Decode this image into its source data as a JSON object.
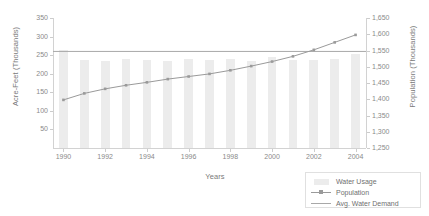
{
  "chart_data": {
    "type": "bar",
    "title": "",
    "xlabel": "Years",
    "ylabel": "Acre-Feet (Thousands)",
    "ylabel_secondary": "Population (Thousands)",
    "grid": false,
    "legend_position": "bottom-right",
    "categories": [
      1990,
      1991,
      1992,
      1993,
      1994,
      1995,
      1996,
      1997,
      1998,
      1999,
      2000,
      2001,
      2002,
      2003,
      2004
    ],
    "x_tick_labels": [
      "1990",
      "1992",
      "1994",
      "1996",
      "1998",
      "2000",
      "2002",
      "2004"
    ],
    "x_tick_values": [
      1990,
      1992,
      1994,
      1996,
      1998,
      2000,
      2002,
      2004
    ],
    "ylim": [
      0,
      350
    ],
    "y_tick_labels": [
      "50",
      "100",
      "150",
      "200",
      "250",
      "300",
      "350"
    ],
    "y_tick_values": [
      50,
      100,
      150,
      200,
      250,
      300,
      350
    ],
    "ylim_secondary": [
      1250,
      1650
    ],
    "y2_tick_labels": [
      "1,250",
      "1,300",
      "1,350",
      "1,400",
      "1,450",
      "1,500",
      "1,550",
      "1,600",
      "1,650"
    ],
    "y2_tick_values": [
      1250,
      1300,
      1350,
      1400,
      1450,
      1500,
      1550,
      1600,
      1650
    ],
    "series": [
      {
        "name": "Water Usage",
        "type": "bar",
        "axis": "left",
        "color": "#ececec",
        "values": [
          265,
          238,
          234,
          241,
          237,
          235,
          239,
          236,
          240,
          234,
          245,
          236,
          238,
          241,
          252
        ]
      },
      {
        "name": "Population",
        "type": "line",
        "axis": "right",
        "color": "#9a9a9a",
        "marker": "square",
        "values": [
          1398,
          1418,
          1432,
          1443,
          1452,
          1462,
          1470,
          1478,
          1489,
          1502,
          1516,
          1532,
          1552,
          1575,
          1598
        ]
      },
      {
        "name": "Avg. Water Demand",
        "type": "line",
        "axis": "left",
        "color": "#a8a8a8",
        "constant": 260,
        "values": [
          260,
          260,
          260,
          260,
          260,
          260,
          260,
          260,
          260,
          260,
          260,
          260,
          260,
          260,
          260
        ]
      }
    ]
  },
  "legend": {
    "items": [
      {
        "label": "Water Usage",
        "key": "bar"
      },
      {
        "label": "Population",
        "key": "line-marker"
      },
      {
        "label": "Avg. Water Demand",
        "key": "line"
      }
    ]
  }
}
